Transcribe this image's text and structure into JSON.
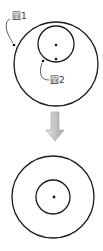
{
  "diagram": {
    "top": {
      "outer_circle_label": "圓1",
      "inner_circle_label": "圓2",
      "description": "Circle 2 inside Circle 1, off-center"
    },
    "arrow": {
      "direction": "down",
      "color": "#bdbdbd"
    },
    "bottom": {
      "description": "Circle 2 concentric with Circle 1"
    },
    "colors": {
      "stroke": "#1a1a1a",
      "arrow_fill": "#c8c8c8",
      "arrow_stroke": "#9a9a9a"
    }
  }
}
